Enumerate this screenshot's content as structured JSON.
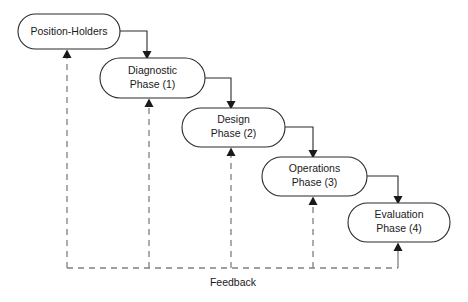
{
  "diagram": {
    "background_color": "#ffffff",
    "box_stroke_color": "#2b2b2b",
    "feedback_color": "#808080",
    "text_color": "#1a1a1a",
    "nodes": [
      {
        "id": "position-holders",
        "line1": "Position-Holders",
        "line2": "",
        "x": 18,
        "y": 14,
        "w": 102,
        "h": 35
      },
      {
        "id": "diagnostic-phase",
        "line1": "Diagnostic",
        "line2": "Phase (1)",
        "x": 100,
        "y": 58,
        "w": 105,
        "h": 40
      },
      {
        "id": "design-phase",
        "line1": "Design",
        "line2": "Phase (2)",
        "x": 182,
        "y": 108,
        "w": 103,
        "h": 39
      },
      {
        "id": "operations-phase",
        "line1": "Operations",
        "line2": "Phase (3)",
        "x": 262,
        "y": 157,
        "w": 105,
        "h": 39
      },
      {
        "id": "evaluation-phase",
        "line1": "Evaluation",
        "line2": "Phase (4)",
        "x": 348,
        "y": 203,
        "w": 102,
        "h": 39
      }
    ],
    "flow_connectors": [
      {
        "id": "position-holders-to-diagnostic",
        "from": "position-holders",
        "to": "diagnostic-phase",
        "path": "M 120 31 L 147 31 L 147 53"
      },
      {
        "id": "diagnostic-to-design",
        "from": "diagnostic-phase",
        "to": "design-phase",
        "path": "M 205 78 L 231 78 L 231 103"
      },
      {
        "id": "design-to-operations",
        "from": "design-phase",
        "to": "operations-phase",
        "path": "M 285 127 L 313 127 L 313 152"
      },
      {
        "id": "operations-to-evaluation",
        "from": "operations-phase",
        "to": "evaluation-phase",
        "path": "M 367 176 L 398 176 L 398 198"
      }
    ],
    "feedback": {
      "label": "Feedback",
      "label_x": 233,
      "label_y": 283,
      "bus_y": 268,
      "bus_start_x": 67,
      "bus_end_x": 398,
      "branches": [
        {
          "id": "feedback-to-position-holders",
          "x": 67,
          "top_y": 54,
          "dashed": true
        },
        {
          "id": "feedback-to-diagnostic",
          "x": 149,
          "top_y": 103,
          "dashed": true
        },
        {
          "id": "feedback-to-design",
          "x": 231,
          "top_y": 152,
          "dashed": true
        },
        {
          "id": "feedback-to-operations",
          "x": 313,
          "top_y": 201,
          "dashed": true
        },
        {
          "id": "feedback-riser-from-evaluation",
          "x": 398,
          "top_y": 247,
          "dashed": false
        }
      ]
    }
  }
}
